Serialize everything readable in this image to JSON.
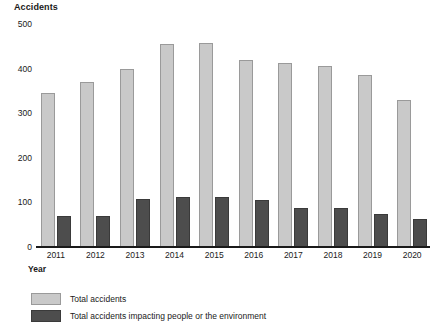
{
  "chart_data": {
    "type": "bar",
    "title": "",
    "xlabel": "Year",
    "ylabel": "Accidents",
    "ylim": [
      0,
      500
    ],
    "yticks": [
      0,
      100,
      200,
      300,
      400,
      500
    ],
    "grid": false,
    "legend_position": "bottom-left",
    "categories": [
      "2011",
      "2012",
      "2013",
      "2014",
      "2015",
      "2016",
      "2017",
      "2018",
      "2019",
      "2020"
    ],
    "series": [
      {
        "name": "Total accidents",
        "color": "#c9c9c9",
        "values": [
          345,
          370,
          400,
          455,
          458,
          420,
          413,
          406,
          385,
          330
        ]
      },
      {
        "name": "Total accidents impacting people or the environment",
        "color": "#4d4d4d",
        "values": [
          70,
          70,
          108,
          112,
          112,
          105,
          88,
          88,
          75,
          62
        ]
      }
    ]
  },
  "legend": {
    "items": [
      {
        "label": "Total accidents",
        "swatch": "total"
      },
      {
        "label": "Total accidents impacting people or the environment",
        "swatch": "impact"
      }
    ]
  }
}
